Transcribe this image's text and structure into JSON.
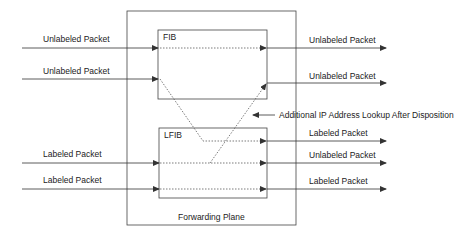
{
  "diagram": {
    "outer_box": {
      "label": "Forwarding Plane"
    },
    "fib": {
      "label": "FIB"
    },
    "lfib": {
      "label": "LFIB"
    },
    "inputs": [
      {
        "label": "Unlabeled Packet",
        "target": "FIB"
      },
      {
        "label": "Unlabeled Packet",
        "target": "FIB"
      },
      {
        "label": "Labeled Packet",
        "target": "LFIB"
      },
      {
        "label": "Labeled Packet",
        "target": "LFIB"
      }
    ],
    "outputs": [
      {
        "label": "Unlabeled Packet",
        "source": "FIB"
      },
      {
        "label": "Unlabeled Packet",
        "source": "FIB"
      },
      {
        "label": "Labeled Packet",
        "source": "LFIB"
      },
      {
        "label": "Unlabeled Packet",
        "source": "LFIB"
      },
      {
        "label": "Labeled Packet",
        "source": "LFIB"
      }
    ],
    "annotation": "Additional IP Address Lookup After Disposition",
    "colors": {
      "line": "#333333",
      "text": "#222222",
      "background": "#ffffff"
    }
  }
}
